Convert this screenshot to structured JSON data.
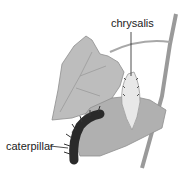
{
  "labels": {
    "chrysalis": "chrysalis",
    "caterpillar": "caterpillar"
  },
  "colors": {
    "leaf": "#b8b8b8",
    "leaf_dark": "#8e8e8e",
    "stem": "#9a9a9a",
    "caterpillar": "#2a2a2a",
    "chrysalis": "#e6e6e6",
    "text": "#222222"
  }
}
